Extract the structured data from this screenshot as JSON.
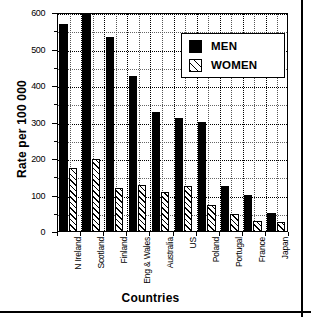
{
  "chart_data": {
    "type": "bar",
    "title": "",
    "xlabel": "Countries",
    "ylabel": "Rate per 100 000",
    "ylim": [
      0,
      600
    ],
    "yticks": [
      0,
      100,
      200,
      300,
      400,
      500,
      600
    ],
    "ytick_labels": [
      "0",
      "100",
      "200",
      "300",
      "400",
      "500",
      "600"
    ],
    "grid": true,
    "legend_position": "upper right",
    "categories": [
      "N Ireland",
      "Scotland",
      "Finland",
      "Eng & Wales",
      "Australia",
      "US",
      "Poland",
      "Portugal",
      "France",
      "Japan"
    ],
    "series": [
      {
        "name": "MEN",
        "fill": "solid-black",
        "color": "#000000",
        "values": [
          570,
          600,
          535,
          428,
          328,
          313,
          302,
          127,
          101,
          51
        ]
      },
      {
        "name": "WOMEN",
        "fill": "diagonal-hatch",
        "color": "#ffffff",
        "values": [
          175,
          200,
          120,
          130,
          110,
          125,
          75,
          50,
          30,
          27
        ]
      }
    ]
  },
  "legend": {
    "entries": [
      {
        "label": "MEN",
        "swatch": "solid-square-icon"
      },
      {
        "label": "WOMEN",
        "swatch": "hatched-square-icon"
      }
    ]
  }
}
